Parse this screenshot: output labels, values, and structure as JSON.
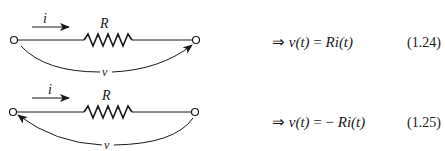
{
  "circuits": [
    {
      "id": "top",
      "current_label": "i",
      "resistor_label": "R",
      "voltage_label": "v",
      "voltage_arrow_direction": "left-to-right",
      "equation": {
        "arrow": "⇒",
        "lhs": "v(t)",
        "equals": "=",
        "sign": "",
        "rhs": "Ri(t)"
      },
      "equation_number": "(1.24)"
    },
    {
      "id": "bottom",
      "current_label": "i",
      "resistor_label": "R",
      "voltage_label": "v",
      "voltage_arrow_direction": "right-to-left",
      "equation": {
        "arrow": "⇒",
        "lhs": "v(t)",
        "equals": "=",
        "sign": "−",
        "rhs": "Ri(t)"
      },
      "equation_number": "(1.25)"
    }
  ],
  "colors": {
    "ink": "#1a1a1a",
    "background": "#ffffff"
  }
}
